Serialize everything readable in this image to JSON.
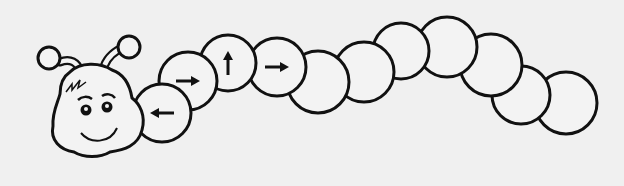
{
  "colors": {
    "background": "#f0f0f0",
    "stroke": "#111111",
    "fill": "#f3f3f3"
  },
  "segments": [
    {
      "cx": 162,
      "cy": 113,
      "r": 29,
      "arrow": "left"
    },
    {
      "cx": 188,
      "cy": 81,
      "r": 29,
      "arrow": "right"
    },
    {
      "cx": 228,
      "cy": 63,
      "r": 28,
      "arrow": "up"
    },
    {
      "cx": 277,
      "cy": 67,
      "r": 29,
      "arrow": "right"
    },
    {
      "cx": 318,
      "cy": 82,
      "r": 31,
      "arrow": ""
    },
    {
      "cx": 364,
      "cy": 72,
      "r": 30,
      "arrow": ""
    },
    {
      "cx": 401,
      "cy": 51,
      "r": 28,
      "arrow": ""
    },
    {
      "cx": 447,
      "cy": 47,
      "r": 30,
      "arrow": ""
    },
    {
      "cx": 491,
      "cy": 65,
      "r": 31,
      "arrow": ""
    },
    {
      "cx": 521,
      "cy": 95,
      "r": 29,
      "arrow": ""
    },
    {
      "cx": 566,
      "cy": 103,
      "r": 31,
      "arrow": ""
    }
  ]
}
